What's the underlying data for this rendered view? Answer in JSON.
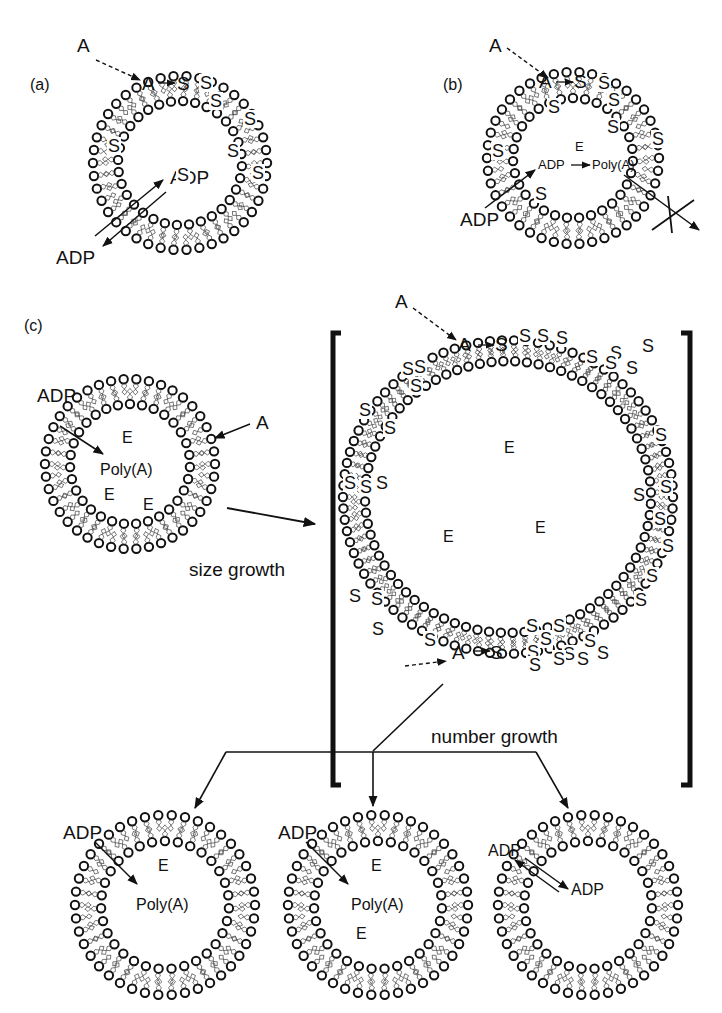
{
  "figure": {
    "panels": [
      {
        "id": "a",
        "label": "(a)",
        "external_monomer": "A",
        "membrane_reaction": {
          "reactant": "A",
          "product": "S"
        },
        "transport": {
          "inward": "ADP",
          "outward": "ADP"
        },
        "surface_S_count": 7
      },
      {
        "id": "b",
        "label": "(b)",
        "external_monomer": "A",
        "membrane_reaction": {
          "reactant": "A",
          "product": "S"
        },
        "substrate_in": "ADP",
        "enzyme": "E",
        "internal_reaction": {
          "reactant": "ADP",
          "catalyst": "E",
          "product": "Poly(A)"
        },
        "blocked_efflux": "Poly(A) cannot leave",
        "surface_S_count": 7
      },
      {
        "id": "c",
        "label": "(c)",
        "parent_vesicle": {
          "substrate_in": "ADP",
          "external_monomer": "A",
          "contents": [
            "E",
            "Poly(A)",
            "E",
            "E"
          ]
        },
        "size_growth_label": "size growth",
        "grown_vesicle": {
          "external_monomer": "A",
          "top_reaction": {
            "reactant": "A",
            "product": "S"
          },
          "bottom_reaction": {
            "reactant": "A",
            "product": "S"
          },
          "contents": [
            "E",
            "E",
            "E"
          ]
        },
        "number_growth_label": "number growth",
        "daughters": [
          {
            "substrate_in": "ADP",
            "contents": [
              "E",
              "Poly(A)"
            ]
          },
          {
            "substrate_in": "ADP",
            "contents": [
              "E",
              "Poly(A)",
              "E"
            ]
          },
          {
            "transport": {
              "outward": "ADP",
              "inward": "ADP"
            },
            "contents": []
          }
        ]
      }
    ],
    "legend_symbols": {
      "A": "amphiphile precursor",
      "S": "surfactant / amphiphile",
      "E": "enzyme",
      "ADP": "adenosine diphosphate",
      "Poly(A)": "polyadenylic acid"
    }
  }
}
